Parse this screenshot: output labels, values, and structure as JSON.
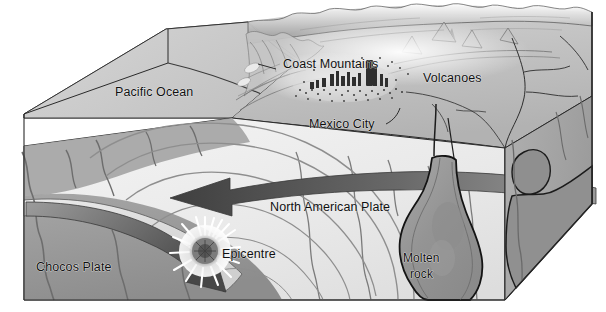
{
  "figure": {
    "type": "block-diagram",
    "background_color": "#ffffff",
    "label_color": "#101010"
  },
  "labels": {
    "pacific_ocean": "Pacific Ocean",
    "coast_mountains": "Coast Mountains",
    "volcanoes": "Volcanoes",
    "mexico_city": "Mexico City",
    "north_american_plate": "North American Plate",
    "chocos_plate": "Chocos Plate",
    "epicentre": "Epicentre",
    "molten_rock_line1": "Molten",
    "molten_rock_line2": "rock"
  },
  "palette": {
    "ocean_surface": "#c9c9c9",
    "ocean_side": "#b9b9b9",
    "crust_light": "#ededed",
    "mantle_mid": "#9e9e9e",
    "mantle_dark": "#8a8a8a",
    "right_face": "#a8a8a8",
    "land_surface": "#bdbdbd",
    "outline": "#1a1a1a",
    "arrow_dark": "#4a4a4a",
    "epicentre_core": "#6e6e6e",
    "epicentre_halo": "#ffffff",
    "molten_fill": "#9a9a9a",
    "city_dots": "#3a3a3a"
  },
  "features": [
    {
      "name": "pacific-ocean-slab",
      "kind": "surface"
    },
    {
      "name": "coast-mountains-range",
      "kind": "terrain"
    },
    {
      "name": "volcanic-range",
      "kind": "terrain"
    },
    {
      "name": "mexico-city-urban-area",
      "kind": "settlement"
    },
    {
      "name": "north-american-plate-body",
      "kind": "plate"
    },
    {
      "name": "chocos-plate-slab",
      "kind": "plate"
    },
    {
      "name": "subduction-arrow",
      "kind": "motion-arrow"
    },
    {
      "name": "convergence-arrow",
      "kind": "motion-arrow"
    },
    {
      "name": "earthquake-epicentre",
      "kind": "event"
    },
    {
      "name": "molten-rock-plume",
      "kind": "magma"
    },
    {
      "name": "seismic-wavefronts",
      "kind": "contours"
    }
  ]
}
